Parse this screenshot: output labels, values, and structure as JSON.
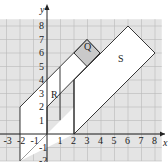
{
  "figure": {
    "axes": {
      "x_label": "x",
      "y_label": "y",
      "x_ticks": [
        "-3",
        "-2",
        "-1",
        "1",
        "2",
        "3",
        "4",
        "5",
        "6",
        "7",
        "8"
      ],
      "y_ticks": [
        "-2",
        "-1",
        "1",
        "2",
        "3",
        "4",
        "5",
        "6",
        "7",
        "8"
      ]
    },
    "regions": [
      {
        "name": "R",
        "label": "R",
        "fill": "#ffffff"
      },
      {
        "name": "Q",
        "label": "Q",
        "fill": "#d0d0d0"
      },
      {
        "name": "S",
        "label": "S",
        "fill": "#ffffff"
      }
    ],
    "colors": {
      "grid_bg": "#e4e4e4",
      "grid_line": "#b8b8b8",
      "outline": "#222222"
    }
  }
}
